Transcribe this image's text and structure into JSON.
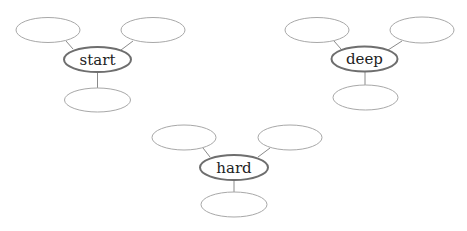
{
  "diagram": {
    "type": "word-web",
    "colors": {
      "hub_stroke": "#6e6e6e",
      "leaf_stroke": "#a8a8a8",
      "link": "#8a8a8a",
      "text": "#222222"
    },
    "webs": [
      {
        "label": "start",
        "hub": {
          "cx": 97.5,
          "cy": 59.5,
          "rx": 33.5,
          "ry": 12.5
        },
        "leaves": [
          {
            "label": "",
            "cx": 48,
            "cy": 30,
            "rx": 32,
            "ry": 12.5
          },
          {
            "label": "",
            "cx": 153,
            "cy": 30,
            "rx": 32,
            "ry": 12.5
          },
          {
            "label": "",
            "cx": 97.5,
            "cy": 100,
            "rx": 33,
            "ry": 12
          }
        ]
      },
      {
        "label": "deep",
        "hub": {
          "cx": 364.5,
          "cy": 59,
          "rx": 33,
          "ry": 12.5
        },
        "leaves": [
          {
            "label": "",
            "cx": 317,
            "cy": 30,
            "rx": 32,
            "ry": 12.5
          },
          {
            "label": "",
            "cx": 422,
            "cy": 30,
            "rx": 32,
            "ry": 13
          },
          {
            "label": "",
            "cx": 365.5,
            "cy": 97.5,
            "rx": 32.5,
            "ry": 12.5
          }
        ]
      },
      {
        "label": "hard",
        "hub": {
          "cx": 234,
          "cy": 167.5,
          "rx": 34,
          "ry": 12.5
        },
        "leaves": [
          {
            "label": "",
            "cx": 184,
            "cy": 137.5,
            "rx": 32,
            "ry": 12.5
          },
          {
            "label": "",
            "cx": 290,
            "cy": 137.5,
            "rx": 32,
            "ry": 12.5
          },
          {
            "label": "",
            "cx": 234,
            "cy": 204.5,
            "rx": 33,
            "ry": 12.5
          }
        ]
      }
    ]
  }
}
